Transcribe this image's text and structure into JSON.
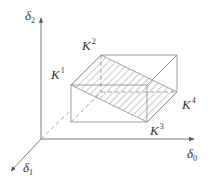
{
  "diagram": {
    "axes": {
      "vertical": {
        "symbol": "δ",
        "subscript": "2"
      },
      "horizontal": {
        "symbol": "δ",
        "subscript": "0"
      },
      "depth": {
        "symbol": "δ",
        "subscript": "1"
      }
    },
    "vertices": [
      {
        "id": "K1",
        "symbol": "K",
        "superscript": "1"
      },
      {
        "id": "K2",
        "symbol": "K",
        "superscript": "2"
      },
      {
        "id": "K3",
        "symbol": "K",
        "superscript": "3"
      },
      {
        "id": "K4",
        "symbol": "K",
        "superscript": "4"
      }
    ],
    "colors": {
      "line": "#8a8a8a",
      "axis": "#6e6e6e",
      "hatch": "#8a8a8a",
      "text": "#333333",
      "background": "#ffffff"
    }
  }
}
